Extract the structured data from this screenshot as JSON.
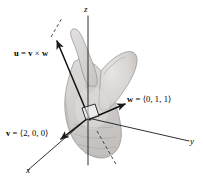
{
  "figure": {
    "background_color": "#ffffff",
    "ink_color": "#1a1a1a",
    "hand_fill_color": "#d8d6d4",
    "hand_shade_color": "#bfbcba",
    "hand_outline_color": "#8d8a88"
  },
  "axes": {
    "x_label": "x",
    "y_label": "y",
    "z_label": "z"
  },
  "vectors": [
    {
      "id": "u",
      "name_plain": "u",
      "label_text": "u = v × w",
      "symbol": "u",
      "equals": "=",
      "operand_a": "v",
      "cross": "×",
      "operand_b": "w"
    },
    {
      "id": "w",
      "name_plain": "w",
      "label_text": "w = ⟨0, 1, 1⟩",
      "symbol": "w",
      "equals": "=",
      "components": "⟨0, 1, 1⟩"
    },
    {
      "id": "v",
      "name_plain": "v",
      "label_text": "v = ⟨2, 0, 0⟩",
      "symbol": "v",
      "equals": "=",
      "components": "⟨2, 0, 0⟩"
    }
  ],
  "annotations": {
    "right_angle_marker": "right-angle-square-at-origin",
    "dashed_extension_upper": "dashed-line-beyond-u-arrowhead",
    "dashed_extension_lower": "dashed-line-opposite-u-direction"
  }
}
